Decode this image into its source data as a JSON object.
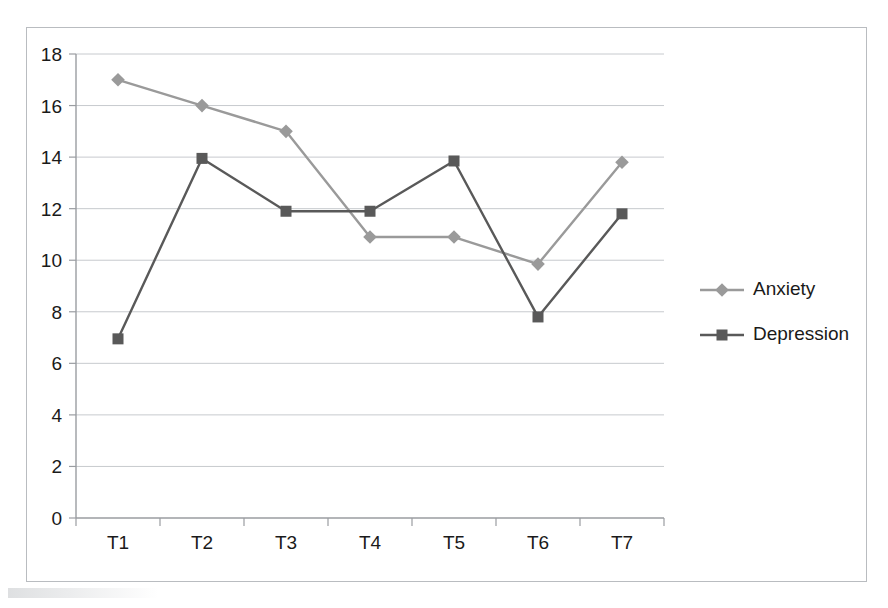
{
  "chart_data": {
    "type": "line",
    "title": "",
    "subtitle": "",
    "xlabel": "",
    "ylabel": "",
    "categories": [
      "T1",
      "T2",
      "T3",
      "T4",
      "T5",
      "T6",
      "T7"
    ],
    "series": [
      {
        "name": "Anxiety",
        "color": "#9a9a9a",
        "marker": "diamond",
        "values": [
          17.0,
          16.0,
          15.0,
          10.9,
          10.9,
          9.85,
          13.8
        ]
      },
      {
        "name": "Depression",
        "color": "#595959",
        "marker": "square",
        "values": [
          6.95,
          13.95,
          11.9,
          11.9,
          13.85,
          7.8,
          11.8
        ]
      }
    ],
    "ylim": [
      0,
      18
    ],
    "yticks": [
      0,
      2,
      4,
      6,
      8,
      10,
      12,
      14,
      16,
      18
    ],
    "ytick_labels": [
      "0",
      "2",
      "4",
      "6",
      "8",
      "10",
      "12",
      "14",
      "16",
      "18"
    ],
    "xtick_labels": [
      "T1",
      "T2",
      "T3",
      "T4",
      "T5",
      "T6",
      "T7"
    ],
    "grid": true,
    "grid_axis": "y",
    "legend_position": "right",
    "legend_entries": [
      "Anxiety",
      "Depression"
    ]
  },
  "legend": {
    "items": [
      {
        "label": "Anxiety",
        "color": "#9a9a9a",
        "marker": "diamond"
      },
      {
        "label": "Depression",
        "color": "#595959",
        "marker": "square"
      }
    ]
  },
  "axes": {
    "y_labels": [
      "18",
      "16",
      "14",
      "12",
      "10",
      "8",
      "6",
      "4",
      "2",
      "0"
    ],
    "x_labels": [
      "T1",
      "T2",
      "T3",
      "T4",
      "T5",
      "T6",
      "T7"
    ]
  },
  "colors": {
    "anxiety": "#9a9a9a",
    "depression": "#595959",
    "gridline": "#c7cace",
    "axis": "#9a9da1",
    "frame": "#b9bcc0",
    "text": "#1a1a1a",
    "background": "#ffffff"
  }
}
